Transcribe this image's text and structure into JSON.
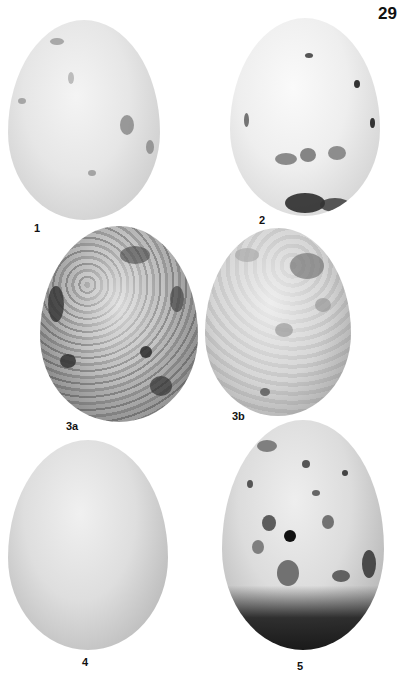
{
  "page": {
    "number": "29",
    "background": "#ffffff"
  },
  "plate": {
    "eggs": [
      {
        "id": "1",
        "label": "1",
        "description": "pale egg with sparse faint grey spots"
      },
      {
        "id": "2",
        "label": "2",
        "description": "pale egg with grey-brown blotches concentrated at the broad end"
      },
      {
        "id": "3a",
        "label": "3a",
        "description": "heavily mottled dark grey egg"
      },
      {
        "id": "3b",
        "label": "3b",
        "description": "pale grey mottled egg with a darker patch near the top"
      },
      {
        "id": "4",
        "label": "4",
        "description": "plain unmarked pale egg"
      },
      {
        "id": "5",
        "label": "5",
        "description": "spotted egg with a dark band at the broad end"
      }
    ]
  }
}
